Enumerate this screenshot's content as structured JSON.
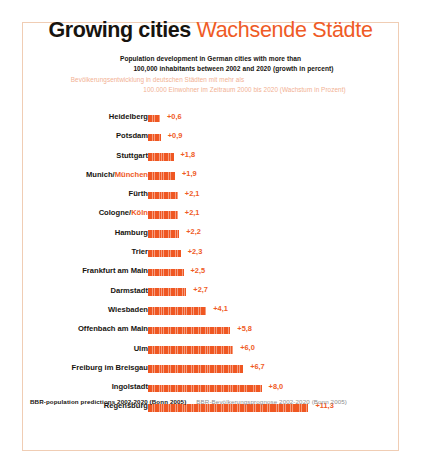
{
  "title": {
    "english": "Growing cities",
    "german": "Wachsende Städte"
  },
  "subtitle": {
    "english_line1": "Population development in German cities with more than",
    "english_line2": "100,000 inhabitants between 2002 and 2020 (growth in percent)",
    "german_line1": "Bevölkerungsentwicklung in deutschen Städten mit mehr als",
    "german_line2": "100.000 Einwohner im Zeitraum 2000 bis 2020 (Wachstum in Prozent)"
  },
  "footer": {
    "source_english": "BBR-population predictions 2002-2020 (Bonn 2005)",
    "source_german": "BBR-Bevölkerungsprognose 2002-2020 (Bonn 2005)"
  },
  "colors": {
    "bar": "#ef5722",
    "accent": "#ef5b25",
    "text": "#17140f",
    "frame": "#f0cdb4",
    "muted_german": "#f2b193",
    "footer_german": "#8d8d8d"
  },
  "chart_data": {
    "type": "bar",
    "orientation": "horizontal",
    "subtitle": "Population development in German cities with more than 100,000 inhabitants between 2002 and 2020 (growth in percent)",
    "xlabel": "",
    "ylabel": "",
    "xlim": [
      0,
      11.3
    ],
    "grid": false,
    "legend": false,
    "value_prefix": "+",
    "decimal_separator": ",",
    "categories": [
      "Heidelberg",
      "Potsdam",
      "Stuttgart",
      "Munich/München",
      "Fürth",
      "Cologne/Köln",
      "Hamburg",
      "Trier",
      "Frankfurt am Main",
      "Darmstadt",
      "Wiesbaden",
      "Offenbach am Main",
      "Ulm",
      "Freiburg im Breisgau",
      "Ingolstadt",
      "Regensburg"
    ],
    "values": [
      0.6,
      0.9,
      1.8,
      1.9,
      2.1,
      2.1,
      2.2,
      2.3,
      2.5,
      2.7,
      4.1,
      5.8,
      6.0,
      6.7,
      8.0,
      11.3
    ],
    "rows": [
      {
        "label_main": "Heidelberg",
        "label_alt": "",
        "value": 0.6,
        "value_text": "+0,6"
      },
      {
        "label_main": "Potsdam",
        "label_alt": "",
        "value": 0.9,
        "value_text": "+0,9"
      },
      {
        "label_main": "Stuttgart",
        "label_alt": "",
        "value": 1.8,
        "value_text": "+1,8"
      },
      {
        "label_main": "Munich/",
        "label_alt": "München",
        "value": 1.9,
        "value_text": "+1,9"
      },
      {
        "label_main": "Fürth",
        "label_alt": "",
        "value": 2.1,
        "value_text": "+2,1"
      },
      {
        "label_main": "Cologne/",
        "label_alt": "Köln",
        "value": 2.1,
        "value_text": "+2,1"
      },
      {
        "label_main": "Hamburg",
        "label_alt": "",
        "value": 2.2,
        "value_text": "+2,2"
      },
      {
        "label_main": "Trier",
        "label_alt": "",
        "value": 2.3,
        "value_text": "+2,3"
      },
      {
        "label_main": "Frankfurt am Main",
        "label_alt": "",
        "value": 2.5,
        "value_text": "+2,5"
      },
      {
        "label_main": "Darmstadt",
        "label_alt": "",
        "value": 2.7,
        "value_text": "+2,7"
      },
      {
        "label_main": "Wiesbaden",
        "label_alt": "",
        "value": 4.1,
        "value_text": "+4,1"
      },
      {
        "label_main": "Offenbach am Main",
        "label_alt": "",
        "value": 5.8,
        "value_text": "+5,8"
      },
      {
        "label_main": "Ulm",
        "label_alt": "",
        "value": 6.0,
        "value_text": "+6,0"
      },
      {
        "label_main": "Freiburg im Breisgau",
        "label_alt": "",
        "value": 6.7,
        "value_text": "+6,7"
      },
      {
        "label_main": "Ingolstadt",
        "label_alt": "",
        "value": 8.0,
        "value_text": "+8,0"
      },
      {
        "label_main": "Regensburg",
        "label_alt": "",
        "value": 11.3,
        "value_text": "+11,3"
      }
    ]
  },
  "render": {
    "px_per_unit": 14.2,
    "bar_min_px": 12
  }
}
